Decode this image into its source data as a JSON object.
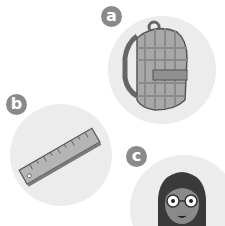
{
  "items": [
    {
      "label": "a",
      "subject": "backpack"
    },
    {
      "label": "b",
      "subject": "ruler"
    },
    {
      "label": "c",
      "subject": "girl-with-glasses"
    }
  ],
  "colors": {
    "badge": "#8a8a8a",
    "circle_bg": "#ececec"
  }
}
